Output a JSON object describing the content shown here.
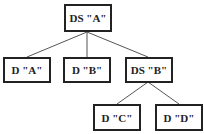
{
  "tree": {
    "nodes": [
      {
        "id": "ds-a",
        "label": "DS \"A\"",
        "type": "DS"
      },
      {
        "id": "d-a",
        "label": "D \"A\"",
        "type": "D"
      },
      {
        "id": "d-b",
        "label": "D \"B\"",
        "type": "D"
      },
      {
        "id": "ds-b",
        "label": "DS \"B\"",
        "type": "DS"
      },
      {
        "id": "d-c",
        "label": "D \"C\"",
        "type": "D"
      },
      {
        "id": "d-d",
        "label": "D \"D\"",
        "type": "D"
      }
    ],
    "edges": [
      {
        "from": "ds-a",
        "to": "d-a"
      },
      {
        "from": "ds-a",
        "to": "d-b"
      },
      {
        "from": "ds-a",
        "to": "ds-b"
      },
      {
        "from": "ds-b",
        "to": "d-c"
      },
      {
        "from": "ds-b",
        "to": "d-d"
      }
    ]
  },
  "colors": {
    "border": "#222222",
    "edge": "#555555",
    "background": "#ffffff"
  }
}
